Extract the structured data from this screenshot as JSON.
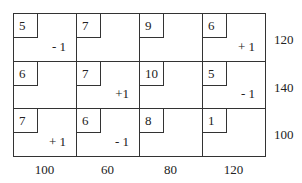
{
  "table": {
    "rows": [
      [
        {
          "cost": "5",
          "delta": "- 1"
        },
        {
          "cost": "7",
          "delta": ""
        },
        {
          "cost": "9",
          "delta": ""
        },
        {
          "cost": "6",
          "delta": "+ 1"
        }
      ],
      [
        {
          "cost": "6",
          "delta": ""
        },
        {
          "cost": "7",
          "delta": "+1"
        },
        {
          "cost": "10",
          "delta": ""
        },
        {
          "cost": "5",
          "delta": "- 1"
        }
      ],
      [
        {
          "cost": "7",
          "delta": "+ 1"
        },
        {
          "cost": "6",
          "delta": "- 1"
        },
        {
          "cost": "8",
          "delta": ""
        },
        {
          "cost": "1",
          "delta": ""
        }
      ]
    ],
    "supply": [
      "120",
      "140",
      "100"
    ],
    "demand": [
      "100",
      "60",
      "80",
      "120"
    ]
  }
}
